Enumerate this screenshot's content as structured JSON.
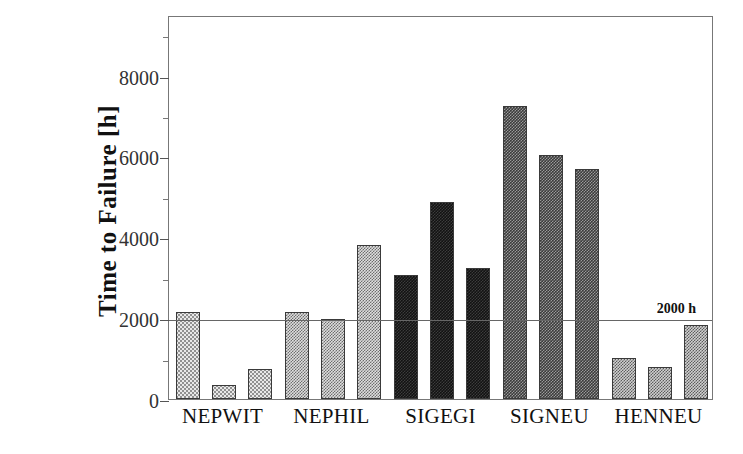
{
  "chart_data": {
    "type": "bar",
    "title": "",
    "xlabel": "",
    "ylabel": "Time to Failure [h]",
    "ylim": [
      0,
      9500
    ],
    "grid": false,
    "legend": null,
    "y_ticks_major": [
      0,
      2000,
      4000,
      6000,
      8000
    ],
    "y_tick_labels": [
      "0",
      "2000",
      "4000",
      "6000",
      "8000"
    ],
    "y_ticks_minor": [
      1000,
      3000,
      5000,
      7000,
      9000
    ],
    "categories": [
      "NEPWIT",
      "NEPHIL",
      "SIGEGI",
      "SIGNEU",
      "HENNEU"
    ],
    "annotations": [
      {
        "text": "2000 h",
        "y": 2000,
        "type": "horizontal-reference-line",
        "label_position": "right"
      }
    ],
    "groups": [
      {
        "category": "NEPWIT",
        "fill": "light",
        "values": [
          2150,
          350,
          750
        ]
      },
      {
        "category": "NEPHIL",
        "fill": "light-med",
        "values": [
          2150,
          1980,
          3820
        ]
      },
      {
        "category": "SIGEGI",
        "fill": "dark",
        "values": [
          3060,
          4870,
          3250
        ]
      },
      {
        "category": "SIGNEU",
        "fill": "medium-dark",
        "values": [
          7250,
          6030,
          5680
        ]
      },
      {
        "category": "HENNEU",
        "fill": "med",
        "values": [
          1020,
          780,
          1820
        ]
      }
    ],
    "series": [
      {
        "name": "bar-1",
        "values": [
          2150,
          2150,
          3060,
          7250,
          1020
        ]
      },
      {
        "name": "bar-2",
        "values": [
          350,
          1980,
          4870,
          6030,
          780
        ]
      },
      {
        "name": "bar-3",
        "values": [
          750,
          3820,
          3250,
          5680,
          1820
        ]
      }
    ]
  },
  "colors": {
    "frame": "#777777",
    "axis_text": "#333333",
    "reference_line": "#666666",
    "bar_outline": "#3a3a3a",
    "background": "#ffffff"
  }
}
